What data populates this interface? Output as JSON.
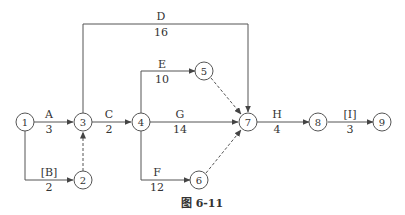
{
  "diagram": {
    "type": "activity-on-arrow network",
    "caption": "图 6-11",
    "nodes": [
      {
        "id": "1",
        "label": "1"
      },
      {
        "id": "2",
        "label": "2"
      },
      {
        "id": "3",
        "label": "3"
      },
      {
        "id": "4",
        "label": "4"
      },
      {
        "id": "5",
        "label": "5"
      },
      {
        "id": "6",
        "label": "6"
      },
      {
        "id": "7",
        "label": "7"
      },
      {
        "id": "8",
        "label": "8"
      },
      {
        "id": "9",
        "label": "9"
      }
    ],
    "activities": [
      {
        "name": "A",
        "duration": "3",
        "from": "1",
        "to": "3"
      },
      {
        "name": "[B]",
        "duration": "2",
        "from": "1",
        "to": "2"
      },
      {
        "name": "C",
        "duration": "2",
        "from": "3",
        "to": "4"
      },
      {
        "name": "D",
        "duration": "16",
        "from": "3",
        "to": "7"
      },
      {
        "name": "E",
        "duration": "10",
        "from": "4",
        "to": "5"
      },
      {
        "name": "F",
        "duration": "12",
        "from": "4",
        "to": "6"
      },
      {
        "name": "G",
        "duration": "14",
        "from": "4",
        "to": "7"
      },
      {
        "name": "H",
        "duration": "4",
        "from": "7",
        "to": "8"
      },
      {
        "name": "[I]",
        "duration": "3",
        "from": "8",
        "to": "9"
      }
    ],
    "dummies": [
      {
        "from": "2",
        "to": "3"
      },
      {
        "from": "5",
        "to": "7"
      },
      {
        "from": "6",
        "to": "7"
      }
    ],
    "colors": {
      "line": "#555555",
      "text": "#333333",
      "background": "#ffffff"
    }
  }
}
